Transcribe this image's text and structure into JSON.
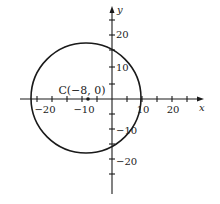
{
  "diagram": {
    "type": "coordinate-plane-circle",
    "center_label": "C(−8, 0)",
    "center": [
      -8,
      0
    ],
    "radius_units": 18,
    "x_axis_label": "x",
    "y_axis_label": "y",
    "x_tick_labels": [
      "−20",
      "−10",
      "10",
      "20"
    ],
    "y_tick_labels": [
      "20",
      "10",
      "−10",
      "−20"
    ],
    "tick_step": 5,
    "colors": {
      "stroke": "#1a1a1a",
      "text": "#222222"
    }
  }
}
